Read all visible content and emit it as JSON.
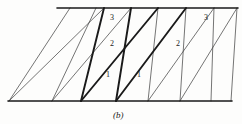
{
  "figure": {
    "caption": "(b)",
    "caption_x": 113,
    "caption_y": 110,
    "width": 242,
    "height": 124,
    "background": "#fdfdfc",
    "ink_color": "#1a1a1a",
    "thin_color": "#3a3a3a",
    "thin_width": 0.7,
    "bold_width": 1.9,
    "rule_width": 1.6,
    "top_rule": {
      "x1": 57,
      "y1": 8,
      "x2": 238,
      "y2": 8
    },
    "bottom_rule": {
      "x1": 8,
      "y1": 101,
      "x2": 232,
      "y2": 101
    },
    "steep_lines": [
      {
        "name": "steep-1",
        "x_top": 70,
        "y_top": 8,
        "x_bottom": 9,
        "y_bottom": 101,
        "bold": false
      },
      {
        "name": "steep-2",
        "x_top": 96,
        "y_top": 8,
        "x_bottom": 52,
        "y_bottom": 101,
        "bold": false
      },
      {
        "name": "steep-3",
        "x_top": 104,
        "y_top": 8,
        "x_bottom": 81,
        "y_bottom": 101,
        "bold": true
      },
      {
        "name": "steep-4",
        "x_top": 131,
        "y_top": 8,
        "x_bottom": 116,
        "y_bottom": 101,
        "bold": true
      },
      {
        "name": "steep-5",
        "x_top": 158,
        "y_top": 8,
        "x_bottom": 148,
        "y_bottom": 101,
        "bold": false
      },
      {
        "name": "steep-6",
        "x_top": 186,
        "y_top": 8,
        "x_bottom": 180,
        "y_bottom": 101,
        "bold": false
      },
      {
        "name": "steep-7",
        "x_top": 214,
        "y_top": 8,
        "x_bottom": 211,
        "y_bottom": 101,
        "bold": false
      },
      {
        "name": "steep-8",
        "x_top": 237,
        "y_top": 8,
        "x_bottom": 231,
        "y_bottom": 101,
        "bold": false
      }
    ],
    "diagonal_lines": [
      {
        "name": "diag-1",
        "x1": 9,
        "y1": 101,
        "x2": 104,
        "y2": 8,
        "bold": false
      },
      {
        "name": "diag-2",
        "x1": 52,
        "y1": 101,
        "x2": 131,
        "y2": 8,
        "bold": false
      },
      {
        "name": "diag-3",
        "x1": 81,
        "y1": 101,
        "x2": 158,
        "y2": 8,
        "bold": true
      },
      {
        "name": "diag-4",
        "x1": 116,
        "y1": 101,
        "x2": 186,
        "y2": 8,
        "bold": true
      },
      {
        "name": "diag-5",
        "x1": 148,
        "y1": 101,
        "x2": 214,
        "y2": 8,
        "bold": false
      },
      {
        "name": "diag-6",
        "x1": 180,
        "y1": 101,
        "x2": 237,
        "y2": 8,
        "bold": false
      }
    ],
    "labels": [
      {
        "name": "label-3-left",
        "text": "3",
        "x": 110,
        "y": 14
      },
      {
        "name": "label-2-left",
        "text": "2",
        "x": 110,
        "y": 40
      },
      {
        "name": "label-1-left",
        "text": "1",
        "x": 106,
        "y": 71
      },
      {
        "name": "label-1-right",
        "text": "1",
        "x": 137,
        "y": 71
      },
      {
        "name": "label-2-right",
        "text": "2",
        "x": 176,
        "y": 40
      },
      {
        "name": "label-3-right",
        "text": "3",
        "x": 204,
        "y": 14
      }
    ]
  }
}
